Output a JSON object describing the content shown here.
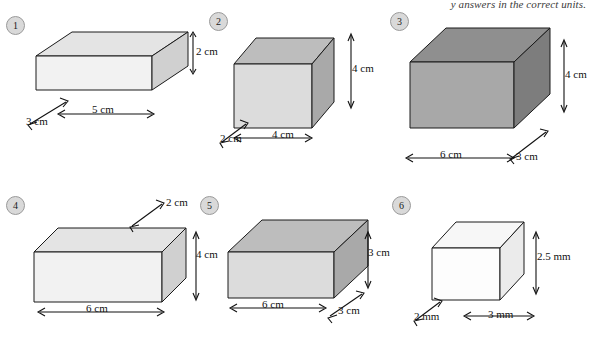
{
  "page": {
    "top_note": "y answers in the correct units."
  },
  "figures": [
    {
      "badge": "1",
      "style": "plain",
      "dims": [
        {
          "name": "height",
          "text": "2 cm"
        },
        {
          "name": "length",
          "text": "5 cm"
        },
        {
          "name": "depth",
          "text": "3 cm"
        }
      ]
    },
    {
      "badge": "2",
      "style": "mid",
      "dims": [
        {
          "name": "height",
          "text": "4 cm"
        },
        {
          "name": "width",
          "text": "4 cm"
        },
        {
          "name": "depth",
          "text": "2 cm"
        }
      ]
    },
    {
      "badge": "3",
      "style": "dark",
      "dims": [
        {
          "name": "height",
          "text": "4 cm"
        },
        {
          "name": "length",
          "text": "6 cm"
        },
        {
          "name": "depth",
          "text": "3 cm"
        }
      ]
    },
    {
      "badge": "4",
      "style": "plain",
      "dims": [
        {
          "name": "depth",
          "text": "2 cm"
        },
        {
          "name": "height",
          "text": "4 cm"
        },
        {
          "name": "length",
          "text": "6 cm"
        }
      ]
    },
    {
      "badge": "5",
      "style": "mid",
      "dims": [
        {
          "name": "height",
          "text": "3 cm"
        },
        {
          "name": "length",
          "text": "6 cm"
        },
        {
          "name": "depth",
          "text": "3 cm"
        }
      ]
    },
    {
      "badge": "6",
      "style": "light",
      "dims": [
        {
          "name": "height",
          "text": "2.5 mm"
        },
        {
          "name": "depth",
          "text": "2 mm"
        },
        {
          "name": "width",
          "text": "3 mm"
        }
      ]
    }
  ]
}
